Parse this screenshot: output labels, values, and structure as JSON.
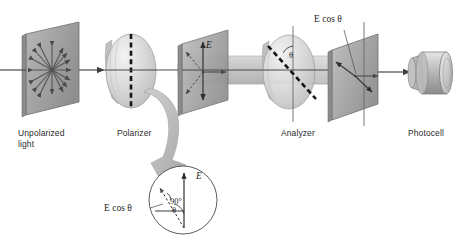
{
  "figure": {
    "width": 462,
    "height": 236,
    "background": "#ffffff"
  },
  "colors": {
    "plate_fill": "#a8a8a8",
    "plate_edge": "#6d6d6d",
    "disk_fill": "#d8d8d8",
    "disk_edge": "#9a9a9a",
    "beam_fill": "#c6c6c6",
    "arrow": "#4a4a4a",
    "axis_line": "#555555",
    "dashed_axis": "#1a1a1a",
    "big_arrow": "#b4b4b4",
    "text": "#2b2b2b"
  },
  "labels": {
    "unpolarized_line1": "Unpolarized",
    "unpolarized_line2": "light",
    "polarizer": "Polarizer",
    "analyzer": "Analyzer",
    "photocell": "Photocell"
  },
  "vectors": {
    "e_field": "E",
    "e_cos_theta_top": "E cos θ",
    "e_cos_theta_inset": "E cos θ",
    "theta_analyzer": "θ",
    "theta_inset": "θ",
    "right_angle": "90°",
    "e_inset": "E"
  },
  "components": [
    {
      "name": "unpolarized-light-plate",
      "kind": "plate",
      "description": "Skewed square plate with eight radial double-headed arrows representing random polarization directions"
    },
    {
      "name": "polarizer-disk",
      "kind": "disk",
      "description": "Elliptical polarizing filter with vertical dashed transmission axis"
    },
    {
      "name": "polarized-light-plate",
      "kind": "plate",
      "description": "Plate showing single vertical E vector after polarizer"
    },
    {
      "name": "analyzer-disk",
      "kind": "disk",
      "description": "Elliptical analyzer with transmission axis rotated by angle theta from vertical"
    },
    {
      "name": "transmitted-light-plate",
      "kind": "plate",
      "description": "Plate showing reduced amplitude E cos theta after analyzer"
    },
    {
      "name": "photocell",
      "kind": "cylinder",
      "description": "Cylindrical photocell detector at the end of the optical train"
    },
    {
      "name": "inset-circle",
      "kind": "detail",
      "description": "Magnified vector diagram: E vertical, E cos theta projection, angle theta, right angle 90 degrees"
    }
  ]
}
